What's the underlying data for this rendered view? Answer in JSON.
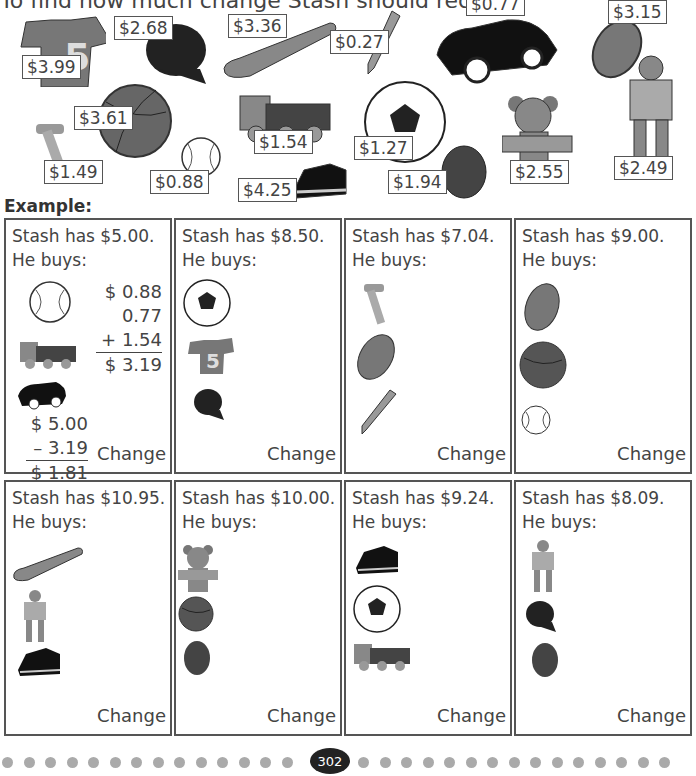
{
  "instructions": "To find how much change Stash should receive.",
  "catalog": [
    {
      "item": "jersey",
      "price": "$3.99"
    },
    {
      "item": "cap",
      "price": "$2.68"
    },
    {
      "item": "bat",
      "price": "$3.36"
    },
    {
      "item": "pencil",
      "price": "$0.27"
    },
    {
      "item": "car",
      "price": "$0.77"
    },
    {
      "item": "football",
      "price": "$3.15"
    },
    {
      "item": "basketball",
      "price": "$3.61"
    },
    {
      "item": "hammer",
      "price": "$1.49"
    },
    {
      "item": "baseball",
      "price": "$0.88"
    },
    {
      "item": "train",
      "price": "$1.54"
    },
    {
      "item": "sneaker",
      "price": "$4.25"
    },
    {
      "item": "soccer-ball",
      "price": "$1.27"
    },
    {
      "item": "mitt",
      "price": "$1.94"
    },
    {
      "item": "teddy-bear",
      "price": "$2.55"
    },
    {
      "item": "robot",
      "price": "$2.49"
    }
  ],
  "example_label": "Example:",
  "buys_label": "He buys:",
  "change_label": "Change",
  "problems": [
    {
      "has": "Stash has $5.00.",
      "items": [
        "baseball",
        "train",
        "car"
      ],
      "work": {
        "addends": [
          "$ 0.88",
          "0.77",
          "+ 1.54"
        ],
        "sum": "$ 3.19",
        "start": "$ 5.00",
        "minus": "– 3.19",
        "result": "$ 1.81"
      }
    },
    {
      "has": "Stash has $8.50.",
      "items": [
        "soccer-ball",
        "jersey",
        "cap"
      ]
    },
    {
      "has": "Stash has $7.04.",
      "items": [
        "hammer",
        "football",
        "pencil"
      ]
    },
    {
      "has": "Stash has $9.00.",
      "items": [
        "football",
        "basketball",
        "baseball"
      ]
    },
    {
      "has": "Stash has $10.95.",
      "items": [
        "bat",
        "robot",
        "sneaker"
      ]
    },
    {
      "has": "Stash has $10.00.",
      "items": [
        "teddy-bear",
        "basketball",
        "mitt"
      ]
    },
    {
      "has": "Stash has $9.24.",
      "items": [
        "sneaker",
        "soccer-ball",
        "train"
      ]
    },
    {
      "has": "Stash has $8.09.",
      "items": [
        "robot",
        "cap",
        "mitt"
      ]
    }
  ],
  "page_number": "302"
}
